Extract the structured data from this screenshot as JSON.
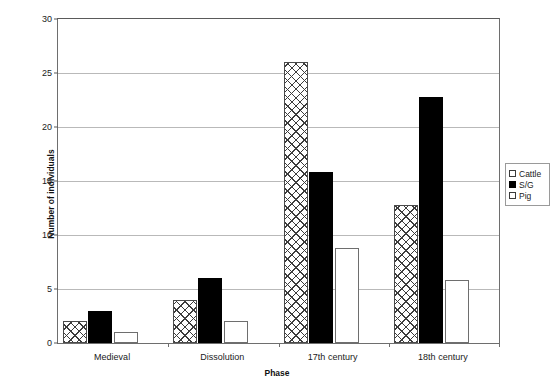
{
  "chart_data": {
    "type": "bar",
    "title": "",
    "xlabel": "Phase",
    "ylabel": "Number of individuals",
    "categories": [
      "Medieval",
      "Dissolution",
      "17th century",
      "18th century"
    ],
    "series": [
      {
        "name": "Cattle",
        "values": [
          2,
          4,
          26,
          12.8
        ],
        "color": "#ffffff",
        "pattern": "crosshatch"
      },
      {
        "name": "S/G",
        "values": [
          3,
          6,
          15.8,
          22.8
        ],
        "color": "#000000",
        "pattern": "solid"
      },
      {
        "name": "Pig",
        "values": [
          1,
          2,
          8.8,
          5.8
        ],
        "color": "#ffffff",
        "pattern": "none"
      }
    ],
    "ylim": [
      0,
      30
    ],
    "yticks": [
      0,
      5,
      10,
      15,
      20,
      25,
      30
    ],
    "ytick_labels": [
      "0",
      "5",
      "10",
      "15",
      "20",
      "25",
      "30"
    ],
    "grid": true,
    "legend_position": "right"
  },
  "legend": {
    "items": [
      {
        "label": "Cattle"
      },
      {
        "label": "S/G"
      },
      {
        "label": "Pig"
      }
    ]
  }
}
